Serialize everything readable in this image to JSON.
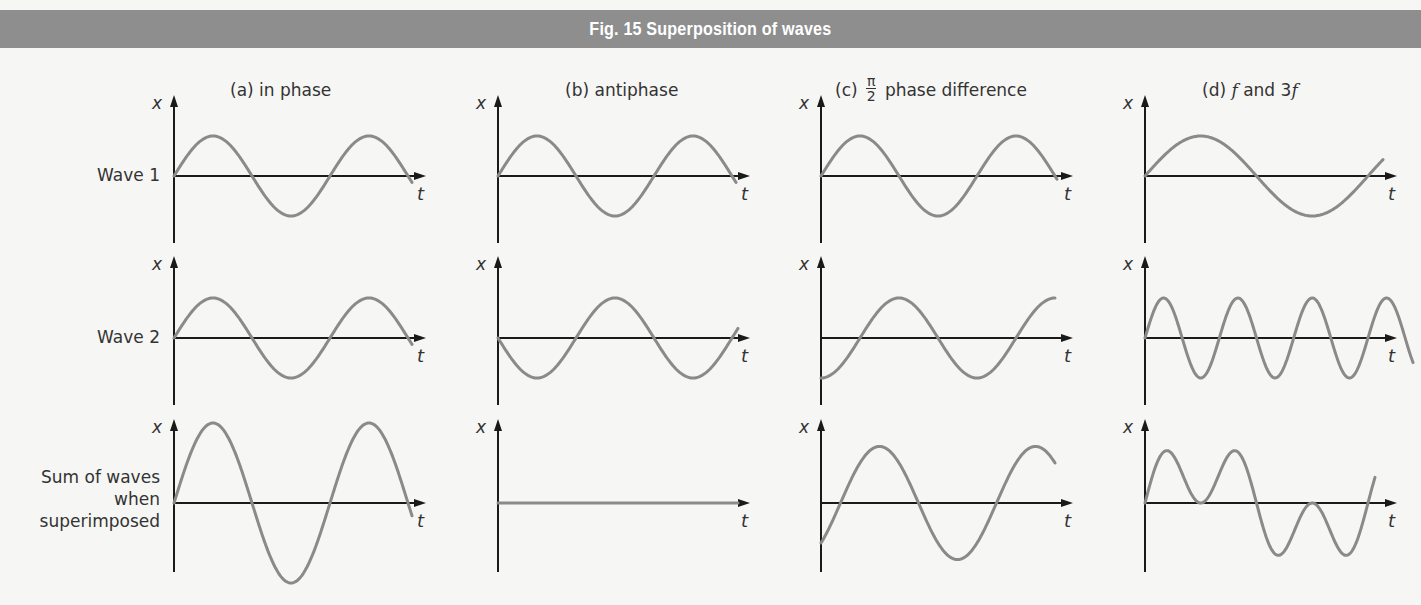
{
  "figure": {
    "title": "Fig. 15 Superposition of waves",
    "banner_color": "#8e8e8e",
    "wave_color": "#8a8a8a",
    "axis_color": "#1a1a1a",
    "axis_labels": {
      "y": "x",
      "x": "t"
    }
  },
  "rows": [
    {
      "id": "wave1",
      "label": "Wave 1"
    },
    {
      "id": "wave2",
      "label": "Wave 2"
    },
    {
      "id": "sum",
      "label_lines": [
        "Sum of waves",
        "when",
        "superimposed"
      ]
    }
  ],
  "columns": [
    {
      "id": "a",
      "title": "(a) in phase"
    },
    {
      "id": "b",
      "title": "(b) antiphase"
    },
    {
      "id": "c",
      "title_prefix": "(c)",
      "title_frac_num": "π",
      "title_frac_den": "2",
      "title_suffix": "phase difference"
    },
    {
      "id": "d",
      "title_prefix": "(d)",
      "title_f1": "f",
      "title_mid": "and 3",
      "title_f2": "f"
    }
  ],
  "chart_data": {
    "type": "line",
    "title": "Fig. 15 Superposition of waves",
    "xlabel": "t",
    "ylabel": "x",
    "grid": false,
    "panels": [
      {
        "column": "(a) in phase",
        "wave1": "A·sin(ωt)",
        "wave2": "A·sin(ωt)",
        "sum": "2A·sin(ωt)",
        "cycles_shown": 1.5
      },
      {
        "column": "(b) antiphase",
        "wave1": "A·sin(ωt)",
        "wave2": "−A·sin(ωt)",
        "sum": "0 (flat line)",
        "cycles_shown": 1.5
      },
      {
        "column": "(c) π/2 phase difference",
        "wave1": "A·sin(ωt)",
        "wave2": "−A·cos(ωt)",
        "sum": "√2·A·sin(ωt − π/4)",
        "cycles_shown": 1.5
      },
      {
        "column": "(d) f and 3f",
        "wave1": "A·sin(ωt)",
        "wave2": "A·sin(3ωt)",
        "sum": "A·sin(ωt) + A·sin(3ωt)",
        "cycles_shown_f": 1.0
      }
    ],
    "relative_amplitude": {
      "wave1": 1,
      "wave2": 1,
      "sum_in_phase": 2,
      "sum_antiphase": 0
    }
  }
}
